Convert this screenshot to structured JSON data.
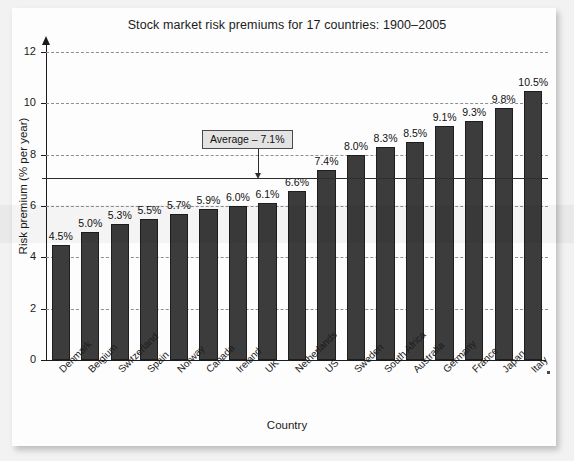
{
  "chart_data": {
    "type": "bar",
    "title": "Stock market risk premiums for 17 countries: 1900–2005",
    "xlabel": "Country",
    "ylabel": "Risk premium (% per year)",
    "ylim": [
      0,
      12
    ],
    "yticks": [
      0,
      2,
      4,
      6,
      8,
      10,
      12
    ],
    "ytick_labels": [
      "0",
      "2",
      "4",
      "6",
      "8",
      "10",
      "12"
    ],
    "grid": "horizontal-dashed",
    "legend": "none",
    "categories": [
      "Denmark",
      "Belgium",
      "Switzerland",
      "Spain",
      "Norway",
      "Canada",
      "Ireland",
      "UK",
      "Netherlands",
      "US",
      "Sweden",
      "South Africa",
      "Australia",
      "Germany",
      "France",
      "Japan",
      "Italy"
    ],
    "values": [
      4.5,
      5.0,
      5.3,
      5.5,
      5.7,
      5.9,
      6.0,
      6.1,
      6.6,
      7.4,
      8.0,
      8.3,
      8.5,
      9.1,
      9.3,
      9.8,
      10.5
    ],
    "value_labels": [
      "4.5%",
      "5.0%",
      "5.3%",
      "5.5%",
      "5.7%",
      "5.9%",
      "6.0%",
      "6.1%",
      "6.6%",
      "7.4%",
      "8.0%",
      "8.3%",
      "8.5%",
      "9.1%",
      "9.3%",
      "9.8%",
      "10.5%"
    ],
    "annotations": [
      {
        "name": "average-line",
        "label": "Average – 7.1%",
        "value": 7.1,
        "style": "solid-horizontal-line-with-callout-box"
      }
    ],
    "colors": {
      "bar_fill": "#3c3c3c",
      "bar_edge": "#1e1e1e",
      "gridline": "#8e8e9a",
      "axis": "#1b1b1b",
      "average_line": "#2e2e2e",
      "callout_box_fill": "#e3e3e3",
      "page_background": "#fdfdfd"
    }
  }
}
